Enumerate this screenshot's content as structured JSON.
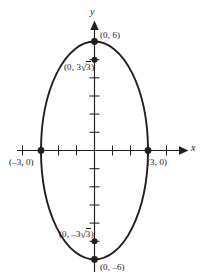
{
  "figure": {
    "type": "ellipse-graph",
    "axis_labels": {
      "x": "x",
      "y": "y"
    },
    "points": [
      {
        "id": "top-vertex",
        "label": "(0, 6)",
        "x": 0,
        "y": 6
      },
      {
        "id": "upper-focus",
        "label_pre": "(0, 3",
        "label_radical": "3",
        "label_post": ")",
        "x": 0,
        "y": 5.196
      },
      {
        "id": "right-vertex",
        "label": "(3, 0)",
        "x": 3,
        "y": 0
      },
      {
        "id": "left-vertex",
        "label": "(–3, 0)",
        "x": -3,
        "y": 0
      },
      {
        "id": "lower-focus",
        "label_pre": "(0, –3",
        "label_radical": "3",
        "label_post": ")",
        "x": 0,
        "y": -5.196
      },
      {
        "id": "bottom-vertex",
        "label": "(0, –6)",
        "x": 0,
        "y": -6
      }
    ],
    "curve": {
      "name": "ellipse",
      "semi_axis_x": 3,
      "semi_axis_y": 6,
      "center": [
        0,
        0
      ],
      "stroke": "#231f20",
      "stroke_width": 1.9
    },
    "axes": {
      "stroke": "#231f20",
      "x_ticks": [
        -4,
        -3,
        -2,
        -1,
        1,
        2,
        3,
        4
      ],
      "y_ticks": [
        -6,
        -5,
        -4,
        -3,
        -2,
        -1,
        1,
        2,
        3,
        4,
        5,
        6
      ]
    }
  }
}
